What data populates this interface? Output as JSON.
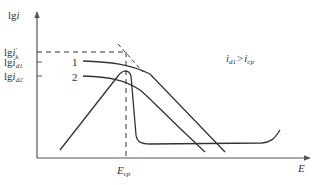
{
  "diagram": {
    "type": "polarization-curve",
    "colors": {
      "line": "#333333",
      "axis": "#555555",
      "background": "#ffffff"
    },
    "y_axis": {
      "label_main": "lg",
      "label_var": "i",
      "ticks": [
        {
          "main": "lg",
          "var": "i",
          "prime": "′",
          "sub": "k",
          "y": 52
        },
        {
          "main": "lg",
          "var": "i",
          "sub": "d1",
          "y": 62
        },
        {
          "main": "lg",
          "var": "i",
          "sub": "d2",
          "y": 76
        }
      ]
    },
    "x_axis": {
      "label": "E",
      "ticks": [
        {
          "main": "E",
          "sub": "cp",
          "x": 126
        }
      ]
    },
    "curve_labels": [
      {
        "text": "1",
        "x": 80,
        "y": 66
      },
      {
        "text": "2",
        "x": 80,
        "y": 80
      }
    ],
    "annotation": {
      "left_var": "i",
      "left_sub": "d1",
      "operator": ">",
      "right_var": "i",
      "right_sub": "cp"
    }
  }
}
